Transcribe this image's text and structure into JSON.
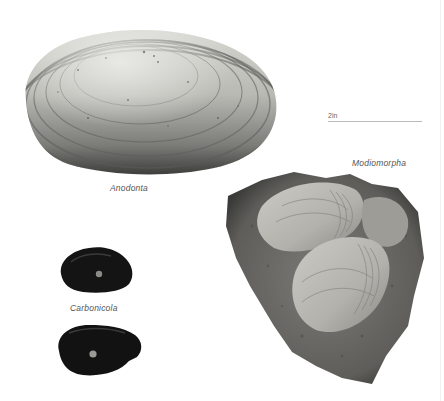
{
  "plate": {
    "scale": {
      "label": "2in"
    },
    "specimens": [
      {
        "name": "Anodonta",
        "label": "Anodonta"
      },
      {
        "name": "Modiomorpha",
        "label": "Modiomorpha"
      },
      {
        "name": "Carbonicola",
        "label": "Carbonicola"
      }
    ],
    "colors": {
      "background": "#ffffff",
      "anodonta_light": "#cfcfca",
      "anodonta_dark": "#4a4a48",
      "carbonicola": "#141414",
      "modiomorpha_rock": "#6e6d6a",
      "modiomorpha_shell": "#b9b8b3",
      "label_text": "#555555"
    }
  }
}
